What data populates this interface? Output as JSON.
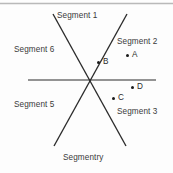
{
  "figure": {
    "background_color": "#fdfdfd",
    "line_color": "#2b2b2b",
    "text_color": "#3a3a3a",
    "top_rule_color": "#b9b9b9"
  },
  "segments": [
    {
      "id": "segment-1",
      "label": "Segment 1",
      "x": 57,
      "y": 12
    },
    {
      "id": "segment-2",
      "label": "Segment 2",
      "x": 117,
      "y": 38
    },
    {
      "id": "segment-3",
      "label": "Segment 3",
      "x": 117,
      "y": 108
    },
    {
      "id": "segment-5",
      "label": "Segment 5",
      "x": 14,
      "y": 101
    },
    {
      "id": "segment-6",
      "label": "Segment 6",
      "x": 14,
      "y": 46
    },
    {
      "id": "segment-4",
      "label": "Segmentry",
      "x": 63,
      "y": 154
    }
  ],
  "points": [
    {
      "id": "point-a",
      "label": "A",
      "dot_x": 126,
      "dot_y": 54,
      "label_x": 132,
      "label_y": 51
    },
    {
      "id": "point-b",
      "label": "B",
      "dot_x": 97,
      "dot_y": 61,
      "label_x": 103,
      "label_y": 58
    },
    {
      "id": "point-c",
      "label": "C",
      "dot_x": 112,
      "dot_y": 97,
      "label_x": 118,
      "label_y": 94
    },
    {
      "id": "point-d",
      "label": "D",
      "dot_x": 131,
      "dot_y": 86,
      "label_x": 137,
      "label_y": 83
    }
  ],
  "lines": {
    "horizontal": {
      "x1": 28,
      "y1": 80,
      "x2": 156,
      "y2": 80
    },
    "diagonal_nw_se": {
      "x1": 53,
      "y1": 14,
      "x2": 126,
      "y2": 146
    },
    "diagonal_ne_sw": {
      "x1": 127,
      "y1": 14,
      "x2": 54,
      "y2": 146
    },
    "intersection": {
      "x": 89,
      "y": 80
    }
  },
  "top_rule": {
    "x1": 0,
    "y1": 3,
    "x2": 173,
    "y2": 3
  }
}
